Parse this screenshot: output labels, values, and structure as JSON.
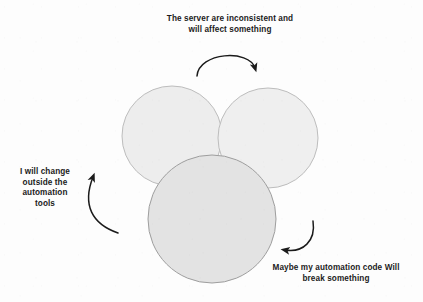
{
  "diagram": {
    "background_color": "#fdfdfd",
    "circles": [
      {
        "id": "circle-left",
        "label": "left-circle",
        "cx": 172,
        "cy": 136,
        "r": 50,
        "fill": "#ededed",
        "stroke": "#bdbdbd"
      },
      {
        "id": "circle-right",
        "label": "right-circle",
        "cx": 268,
        "cy": 138,
        "r": 50,
        "fill": "#efefef",
        "stroke": "#bdbdbd"
      },
      {
        "id": "circle-bottom",
        "label": "bottom-circle",
        "cx": 212,
        "cy": 219,
        "r": 64,
        "fill": "#e3e3e3",
        "stroke": "#9e9e9e"
      }
    ],
    "arrows": [
      {
        "id": "arrow-top",
        "label": "top-arc-arrow",
        "color": "#1b1b1b",
        "points_to": "right-circle"
      },
      {
        "id": "arrow-left",
        "label": "left-arc-arrow",
        "color": "#1b1b1b",
        "points_to": "left-circle"
      },
      {
        "id": "arrow-bottom-right",
        "label": "bottom-right-arc-arrow",
        "color": "#1b1b1b",
        "points_to": "bottom-circle"
      }
    ]
  },
  "captions": {
    "top": "The server are inconsistent and\nwill affect something",
    "left": "I will change\noutside the\nautomation\ntools",
    "bottom_right": "Maybe my automation code Will\nbreak something"
  }
}
